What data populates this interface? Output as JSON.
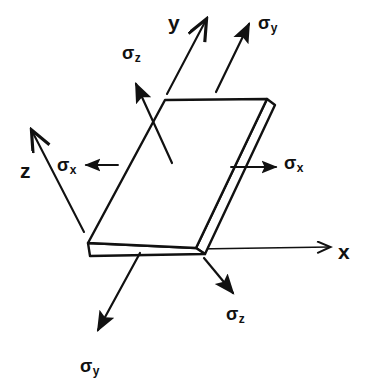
{
  "figure": {
    "background_color": "#ffffff",
    "stroke_color": "#111111",
    "width": 385,
    "height": 391
  },
  "axes": [
    {
      "name": "x-axis",
      "label": "x",
      "direction": "right",
      "label_x": 338,
      "label_y": 241
    },
    {
      "name": "y-axis",
      "label": "y",
      "direction": "up-right",
      "label_x": 168,
      "label_y": 12
    },
    {
      "name": "z-axis",
      "label": "z",
      "direction": "up-left",
      "label_x": 20,
      "label_y": 160
    }
  ],
  "stresses": [
    {
      "name": "sigma-x-right",
      "symbol": "σ",
      "subscript": "x",
      "direction": "right",
      "label_x": 284,
      "label_y": 154
    },
    {
      "name": "sigma-x-left",
      "symbol": "σ",
      "subscript": "x",
      "direction": "left",
      "label_x": 57,
      "label_y": 156
    },
    {
      "name": "sigma-y-top",
      "symbol": "σ",
      "subscript": "y",
      "direction": "up-right",
      "label_x": 258,
      "label_y": 14
    },
    {
      "name": "sigma-y-bottom",
      "symbol": "σ",
      "subscript": "y",
      "direction": "down-left",
      "label_x": 80,
      "label_y": 357
    },
    {
      "name": "sigma-z-top",
      "symbol": "σ",
      "subscript": "z",
      "direction": "up-left",
      "label_x": 122,
      "label_y": 44
    },
    {
      "name": "sigma-z-bottom",
      "symbol": "σ",
      "subscript": "z",
      "direction": "down-right",
      "label_x": 226,
      "label_y": 305
    }
  ],
  "element": {
    "name": "stress-element-slab",
    "shape": "parallelepiped-slab",
    "top_face": "165,100 267,99 196,248 88,243",
    "front_face": "88,243 196,248 196,256 90,256",
    "right_face": "196,248 267,99 275,104 205,253"
  }
}
